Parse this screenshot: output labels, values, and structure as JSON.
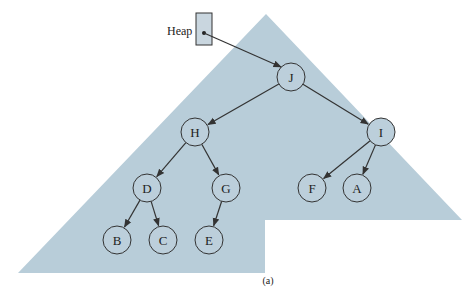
{
  "diagram": {
    "heap_label": "Heap",
    "caption": "(a)",
    "colors": {
      "region": "#b8cdd9",
      "stroke": "#333333",
      "box": "#c9d6df"
    },
    "nodes": [
      {
        "id": "J",
        "label": "J",
        "cx": 291,
        "cy": 77
      },
      {
        "id": "H",
        "label": "H",
        "cx": 195,
        "cy": 132
      },
      {
        "id": "I",
        "label": "I",
        "cx": 381,
        "cy": 132
      },
      {
        "id": "D",
        "label": "D",
        "cx": 147,
        "cy": 188
      },
      {
        "id": "G",
        "label": "G",
        "cx": 226,
        "cy": 188
      },
      {
        "id": "F",
        "label": "F",
        "cx": 312,
        "cy": 188
      },
      {
        "id": "A",
        "label": "A",
        "cx": 357,
        "cy": 188
      },
      {
        "id": "B",
        "label": "B",
        "cx": 117,
        "cy": 240
      },
      {
        "id": "C",
        "label": "C",
        "cx": 163,
        "cy": 240
      },
      {
        "id": "E",
        "label": "E",
        "cx": 209,
        "cy": 240
      }
    ],
    "edges": [
      [
        "J",
        "H"
      ],
      [
        "J",
        "I"
      ],
      [
        "H",
        "D"
      ],
      [
        "H",
        "G"
      ],
      [
        "I",
        "F"
      ],
      [
        "I",
        "A"
      ],
      [
        "D",
        "B"
      ],
      [
        "D",
        "C"
      ],
      [
        "G",
        "E"
      ]
    ]
  }
}
